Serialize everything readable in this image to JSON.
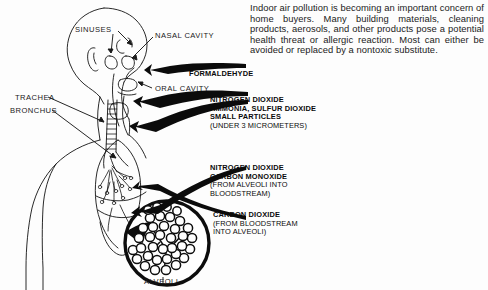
{
  "document": {
    "title": "Indoor Air Pollution and the Respiratory System",
    "background_color": "#fdfdfd",
    "ink_color": "#0a0a0a"
  },
  "intro": {
    "paragraph": "Indoor air pollution is becoming an important concern of home buyers. Many building materials, cleaning products, aerosols, and other products pose a potential health threat or allergic reaction. Most can either be avoided or replaced by a nontoxic substitute."
  },
  "anatomy_labels": [
    {
      "id": "sinuses",
      "text": "SINUSES"
    },
    {
      "id": "nasal-cavity",
      "text": "NASAL CAVITY"
    },
    {
      "id": "oral-cavity",
      "text": "ORAL CAVITY"
    },
    {
      "id": "trachea",
      "text": "TRACHEA"
    },
    {
      "id": "bronchus",
      "text": "BRONCHUS"
    },
    {
      "id": "alveoli",
      "text": "ALVEOLI"
    }
  ],
  "pollutant_callouts": [
    {
      "id": "formaldehyde",
      "lines": [
        "FORMALDEHYDE"
      ],
      "notes": []
    },
    {
      "id": "inhaled-group",
      "lines": [
        "NITROGEN DIOXIDE",
        "AMMONIA, SULFUR DIOXIDE",
        "SMALL PARTICLES"
      ],
      "notes": [
        "(UNDER 3 MICROMETERS)"
      ]
    },
    {
      "id": "alveoli-to-blood",
      "lines": [
        "NITROGEN DIOXIDE",
        "CARBON MONOXIDE"
      ],
      "notes": [
        "(FROM ALVEOLI INTO",
        "BLOODSTREAM)"
      ]
    },
    {
      "id": "blood-to-alveoli",
      "lines": [
        "CARBON DIOXIDE"
      ],
      "notes": [
        "(FROM BLOODSTREAM",
        "INTO ALVEOLI)"
      ]
    }
  ]
}
